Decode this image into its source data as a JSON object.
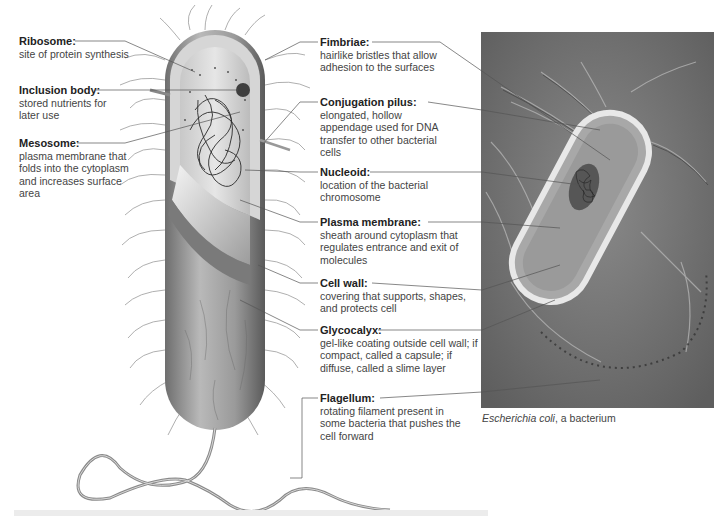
{
  "labels_left": [
    {
      "title": "Ribosome:",
      "desc": "site of protein synthesis"
    },
    {
      "title": "Inclusion body:",
      "desc": "stored nutrients for later use"
    },
    {
      "title": "Mesosome:",
      "desc": "plasma membrane that folds into the cytoplasm and increases surface area"
    }
  ],
  "labels_right": [
    {
      "title": "Fimbriae:",
      "desc": "hairlike bristles that allow adhesion to the surfaces"
    },
    {
      "title": "Conjugation pilus:",
      "desc": "elongated, hollow appendage used for DNA transfer to other bacterial cells"
    },
    {
      "title": "Nucleoid:",
      "desc": "location of the bacterial chromosome"
    },
    {
      "title": "Plasma membrane:",
      "desc": "sheath around cytoplasm that regulates entrance and exit of molecules"
    },
    {
      "title": "Cell wall:",
      "desc": "covering that supports, shapes, and protects cell"
    },
    {
      "title": "Glycocalyx:",
      "desc": "gel-like coating outside cell wall; if compact, called a capsule; if diffuse, called a slime layer"
    },
    {
      "title": "Flagellum:",
      "desc": "rotating filament present in some bacteria that pushes the cell forward"
    }
  ],
  "caption": {
    "species": "Escherichia coli",
    "rest": ", a bacterium"
  }
}
